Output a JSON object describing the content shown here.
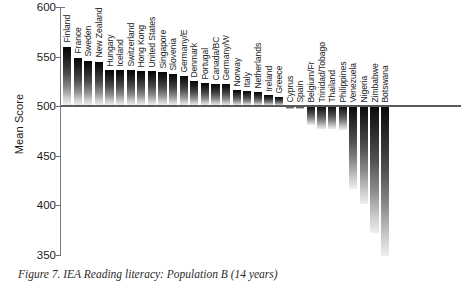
{
  "chart_data": {
    "type": "bar",
    "title": "",
    "xlabel": "",
    "ylabel": "Mean Score",
    "ylim": [
      350,
      600
    ],
    "yticks": [
      600,
      550,
      500,
      450,
      400,
      350
    ],
    "grid": false,
    "legend": null,
    "baseline": 500,
    "note": "Bars diverge from the 500 baseline; countries above 500 rise, below 500 hang downward. Botswana extends below the plotted axis minimum.",
    "categories": [
      "Finland",
      "France",
      "Sweden",
      "New Zealand",
      "Hungary",
      "Iceland",
      "Switzerland",
      "Hong Kong",
      "United States",
      "Singapore",
      "Slovenia",
      "Germany/E",
      "Denmark",
      "Portugal",
      "Canada/BC",
      "Germany/W",
      "Norway",
      "Italy",
      "Netherlands",
      "Ireland",
      "Greece",
      "Cyprus",
      "Spain",
      "Belgium/Fr",
      "Trinidad/Tobago",
      "Thailand",
      "Philippines",
      "Venezuela",
      "Nigeria",
      "Zimbabwe",
      "Botswana"
    ],
    "values": [
      560,
      549,
      546,
      545,
      536,
      536,
      536,
      535,
      535,
      534,
      532,
      530,
      525,
      523,
      522,
      522,
      516,
      515,
      514,
      511,
      509,
      497,
      497,
      481,
      477,
      477,
      476,
      417,
      401,
      372,
      330
    ]
  },
  "axis": {
    "ylabel": "Mean Score",
    "ticks": [
      "600",
      "550",
      "500",
      "450",
      "400",
      "350"
    ]
  },
  "caption": {
    "text": "Figure 7.  IEA Reading literacy: Population B (14 years)"
  }
}
